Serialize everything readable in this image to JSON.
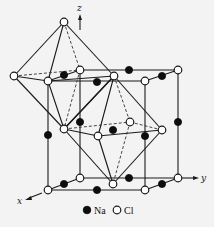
{
  "figure": {
    "axes": {
      "x": "x",
      "y": "y",
      "z": "z"
    },
    "legend": [
      {
        "symbol": "filled-circle",
        "label": "Na",
        "color": "#0d0d0d"
      },
      {
        "symbol": "open-circle",
        "label": "Cl",
        "color": "#ffffff"
      }
    ],
    "colors": {
      "line": "#1a1a1a",
      "background": "#f3f3f3"
    }
  },
  "nodes": {
    "cl": [
      [
        48,
        81
      ],
      [
        80,
        70
      ],
      [
        178,
        70
      ],
      [
        145,
        81
      ],
      [
        114,
        76
      ],
      [
        14,
        76
      ],
      [
        64,
        22
      ],
      [
        64,
        129
      ],
      [
        130,
        122
      ],
      [
        162,
        130
      ],
      [
        98,
        136
      ],
      [
        48,
        190
      ],
      [
        80,
        178
      ],
      [
        178,
        178
      ],
      [
        145,
        190
      ],
      [
        113,
        184
      ]
    ],
    "na": [
      [
        64,
        75
      ],
      [
        129,
        70
      ],
      [
        162,
        76
      ],
      [
        97,
        82
      ],
      [
        48,
        135
      ],
      [
        80,
        122
      ],
      [
        178,
        122
      ],
      [
        145,
        136
      ],
      [
        113,
        130
      ],
      [
        64,
        184
      ],
      [
        129,
        178
      ],
      [
        162,
        184
      ],
      [
        97,
        190
      ]
    ]
  }
}
